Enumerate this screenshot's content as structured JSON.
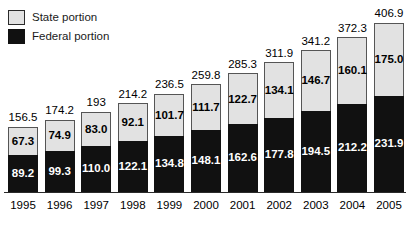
{
  "legend": {
    "position": "top-left",
    "entries": [
      {
        "label": "State portion",
        "color": "#e2e2e2",
        "icon": "state-swatch"
      },
      {
        "label": "Federal portion",
        "color": "#111111",
        "icon": "federal-swatch"
      }
    ]
  },
  "chart_data": {
    "type": "bar",
    "stacked": true,
    "title": "",
    "subtitle": "",
    "xlabel": "",
    "ylabel": "",
    "grid": false,
    "legend_position": "top-left",
    "ylim": [
      0,
      406.9
    ],
    "categories": [
      "1995",
      "1996",
      "1997",
      "1998",
      "1999",
      "2000",
      "2001",
      "2002",
      "2003",
      "2004",
      "2005"
    ],
    "series": [
      {
        "name": "Federal portion",
        "color": "#111111",
        "values": [
          89.2,
          99.3,
          110.0,
          122.1,
          134.8,
          148.1,
          162.6,
          177.8,
          194.5,
          212.2,
          231.9
        ],
        "labels": [
          "89.2",
          "99.3",
          "110.0",
          "122.1",
          "134.8",
          "148.1",
          "162.6",
          "177.8",
          "194.5",
          "212.2",
          "231.9"
        ]
      },
      {
        "name": "State portion",
        "color": "#e2e2e2",
        "values": [
          67.3,
          74.9,
          83.0,
          92.1,
          101.7,
          111.7,
          122.7,
          134.1,
          146.7,
          160.1,
          175.0
        ],
        "labels": [
          "67.3",
          "74.9",
          "83.0",
          "92.1",
          "101.7",
          "111.7",
          "122.7",
          "134.1",
          "146.7",
          "160.1",
          "175.0"
        ]
      }
    ],
    "totals": [
      156.5,
      174.2,
      193.0,
      214.2,
      236.5,
      259.8,
      285.3,
      311.9,
      341.2,
      372.3,
      406.9
    ],
    "total_labels": [
      "156.5",
      "174.2",
      "193",
      "214.2",
      "236.5",
      "259.8",
      "285.3",
      "311.9",
      "341.2",
      "372.3",
      "406.9"
    ]
  }
}
